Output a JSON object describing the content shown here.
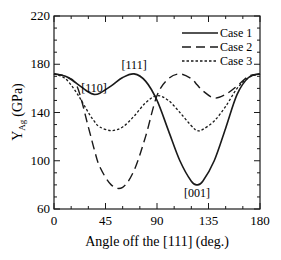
{
  "chart_data": {
    "type": "line",
    "title": "",
    "xlabel": "Angle off the [111] (deg.)",
    "ylabel": "Y_Ag (GPa)",
    "ylabel_main": "Y",
    "ylabel_sub": "Ag",
    "ylabel_unit": "(GPa)",
    "xlim": [
      0,
      180
    ],
    "ylim": [
      60,
      220
    ],
    "xticks": [
      0,
      45,
      90,
      135,
      180
    ],
    "yticks": [
      60,
      100,
      140,
      180,
      220
    ],
    "grid": false,
    "legend_position": "upper right",
    "x": [
      0,
      10,
      20,
      30,
      35,
      40,
      50,
      60,
      70,
      80,
      90,
      100,
      110,
      120,
      125,
      130,
      140,
      150,
      160,
      170,
      180
    ],
    "series": [
      {
        "name": "Case 1",
        "style": "solid",
        "values": [
          172,
          170,
          164,
          157,
          155,
          156,
          162,
          169,
          172,
          166,
          150,
          125,
          100,
          83,
          80,
          83,
          100,
          127,
          155,
          169,
          172
        ]
      },
      {
        "name": "Case 2",
        "style": "dashed",
        "values": [
          172,
          170,
          162,
          128,
          110,
          95,
          80,
          78,
          92,
          120,
          154,
          168,
          172,
          168,
          163,
          158,
          152,
          155,
          162,
          170,
          172
        ]
      },
      {
        "name": "Case 3",
        "style": "dotted",
        "values": [
          172,
          168,
          156,
          140,
          133,
          128,
          125,
          128,
          137,
          148,
          154,
          150,
          140,
          129,
          125,
          126,
          133,
          145,
          160,
          169,
          172
        ]
      }
    ],
    "annotations": [
      {
        "text": "[110]",
        "x": 35,
        "y": 157
      },
      {
        "text": "[111]",
        "x": 70,
        "y": 176
      },
      {
        "text": "[001]",
        "x": 125,
        "y": 70
      }
    ]
  }
}
